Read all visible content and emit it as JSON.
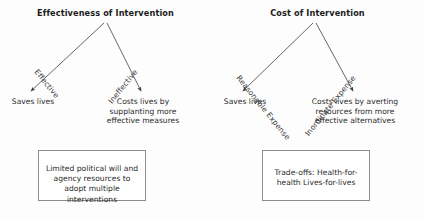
{
  "diagram": {
    "type": "decision-tree-pair",
    "panels": [
      {
        "id": "effectiveness",
        "title": "Effectiveness of Intervention",
        "branches": [
          {
            "id": "left",
            "label": "Effective",
            "outcome": "Saves lives"
          },
          {
            "id": "right",
            "label": "Ineffective",
            "outcome": "Costs lives by supplanting more effective measures"
          }
        ],
        "conclusion": "Limited political will and agency resources to adopt multiple interventions"
      },
      {
        "id": "cost",
        "title": "Cost of Intervention",
        "branches": [
          {
            "id": "left",
            "label": "Reasonable Expense",
            "outcome": "Saves lives"
          },
          {
            "id": "right",
            "label": "Inordinate Expense",
            "outcome": "Costs lives by averting resources from more effective alternatives"
          }
        ],
        "conclusion": "Trade-offs: Health-for-health Lives-for-lives"
      }
    ],
    "colors": {
      "background": "#fdfdfd",
      "text": "#2b2b2b",
      "title_text": "#1c1c1c",
      "arrow": "#404040",
      "box_border": "#8c8c8c",
      "box_fill": "#ffffff"
    }
  }
}
